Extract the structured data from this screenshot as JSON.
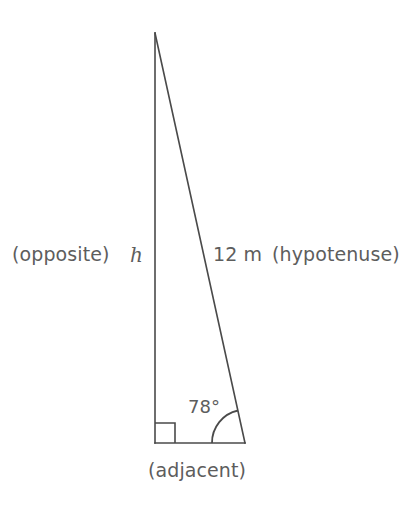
{
  "figure": {
    "caption": "",
    "background_color": "#ffffff",
    "line_color": "#4a4a4a",
    "text_color": "#5d5d5d",
    "type": "right-triangle-trigonometry"
  },
  "labels": {
    "opposite_side_name": "(opposite)",
    "opposite_side_value": "h",
    "hypotenuse_value": "12 m",
    "hypotenuse_name": "(hypotenuse)",
    "adjacent_side_name": "(adjacent)",
    "angle_value": "78°"
  },
  "geometry": {
    "apex": {
      "x": 155,
      "y": 33
    },
    "right_angle_vertex": {
      "x": 155,
      "y": 443
    },
    "angle_vertex": {
      "x": 245,
      "y": 443
    },
    "right_angle_marker_size": 20,
    "angle_arc_radius": 33,
    "angle_degrees": 78,
    "hypotenuse_length_m": 12,
    "opposite_label": "h",
    "stroke_width": 1.6
  }
}
